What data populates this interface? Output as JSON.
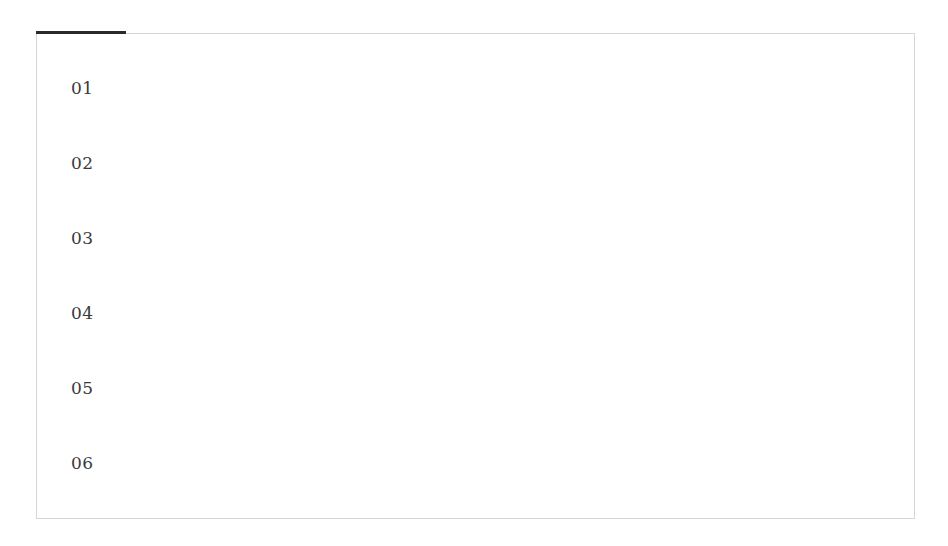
{
  "tab_indicator": {
    "color": "#2a2a2a"
  },
  "list": {
    "items": [
      {
        "label": "01"
      },
      {
        "label": "02"
      },
      {
        "label": "03"
      },
      {
        "label": "04"
      },
      {
        "label": "05"
      },
      {
        "label": "06"
      }
    ]
  }
}
